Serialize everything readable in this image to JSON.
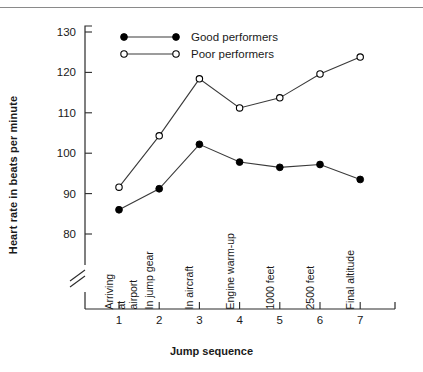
{
  "chart_data": {
    "type": "line",
    "title": "",
    "xlabel": "Jump sequence",
    "ylabel": "Heart rate in beats per minute",
    "x": [
      1,
      2,
      3,
      4,
      5,
      6,
      7
    ],
    "xtick_labels": [
      "1",
      "2",
      "3",
      "4",
      "5",
      "6",
      "7"
    ],
    "categories": [
      "Arriving\nat\nairport",
      "In jump gear",
      "In aircraft",
      "Engine warm-up",
      "1000 feet",
      "2500 feet",
      "Final altitude"
    ],
    "ytick_labels": [
      "80",
      "90",
      "100",
      "110",
      "120",
      "130"
    ],
    "ytick_values": [
      80,
      90,
      100,
      110,
      120,
      130
    ],
    "ylim": [
      80,
      130
    ],
    "xlim": [
      0.45,
      7.6
    ],
    "axis_break": true,
    "grid": false,
    "legend_position": "top-left-inside",
    "series": [
      {
        "name": "Good performers",
        "marker": "filled-circle",
        "color": "#000000",
        "values": [
          86.0,
          91.2,
          102.2,
          97.8,
          96.5,
          97.2,
          93.5
        ]
      },
      {
        "name": "Poor performers",
        "marker": "open-circle",
        "color": "#000000",
        "values": [
          91.6,
          104.3,
          118.4,
          111.2,
          113.7,
          119.6,
          123.8
        ]
      }
    ]
  },
  "legend": {
    "entries": [
      {
        "label": "Good performers"
      },
      {
        "label": "Poor performers"
      }
    ]
  },
  "colors": {
    "axis": "#2b2b2b",
    "line": "#3a3a3a",
    "marker_fill": "#000000",
    "marker_open_fill": "#ffffff",
    "text": "#1a1a1a",
    "rule": "#8a8a8a"
  }
}
